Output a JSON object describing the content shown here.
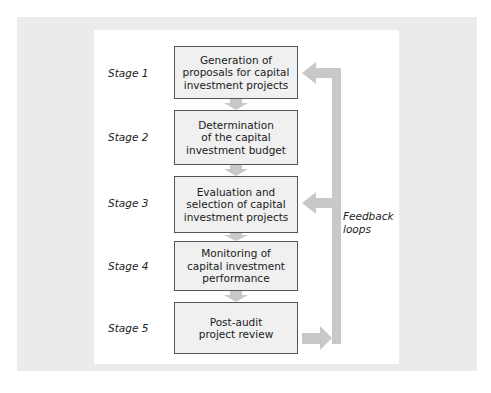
{
  "diagram": {
    "stages": [
      {
        "label": "Stage 1",
        "text": "Generation of proposals for capital investment projects",
        "lines": [
          "Generation of",
          "proposals for capital",
          "investment projects"
        ]
      },
      {
        "label": "Stage 2",
        "text": "Determination of the capital investment budget",
        "lines": [
          "Determination",
          "of the capital",
          "investment budget"
        ]
      },
      {
        "label": "Stage 3",
        "text": "Evaluation and selection of capital investment projects",
        "lines": [
          "Evaluation and",
          "selection of capital",
          "investment projects"
        ]
      },
      {
        "label": "Stage 4",
        "text": "Monitoring of capital investment performance",
        "lines": [
          "Monitoring of",
          "capital investment",
          "performance"
        ]
      },
      {
        "label": "Stage 5",
        "text": "Post-audit project review",
        "lines": [
          "Post-audit",
          "project review"
        ]
      }
    ],
    "feedback_label": [
      "Feedback",
      "loops"
    ],
    "feedback_targets": [
      "Stage 1",
      "Stage 3"
    ],
    "feedback_source": "Stage 5",
    "colors": {
      "arrow": "#c8c8c8",
      "box_fill": "#f0f0f0",
      "box_border": "#555555",
      "background": "#ebebeb"
    }
  }
}
